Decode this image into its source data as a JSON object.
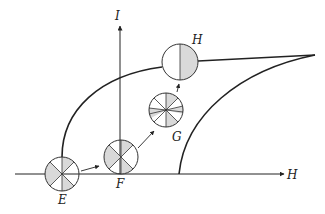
{
  "diagram": {
    "type": "magnetization-curve-domains",
    "axes": {
      "x_label": "H",
      "y_label": "I"
    },
    "states": [
      {
        "label": "E",
        "description": "demagnetized: 4 domain sectors, alternating shaded"
      },
      {
        "label": "F",
        "description": "domain wall motion: shaded sectors grow"
      },
      {
        "label": "G",
        "description": "domains rotated, many thin sectors"
      },
      {
        "label": "H",
        "description": "saturation: two halves, one shaded"
      }
    ],
    "colors": {
      "line": "#222222",
      "shade": "#d9d9d9",
      "background": "#ffffff"
    }
  }
}
